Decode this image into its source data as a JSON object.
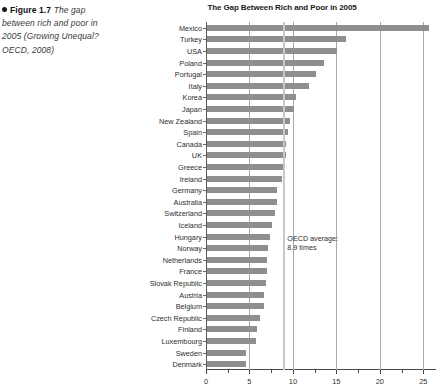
{
  "caption": {
    "figure_label": "Figure 1.7",
    "text": "The gap between rich and poor in 2005 (Growing Unequal? OECD, 2008)",
    "line1": "The gap",
    "line2": "between rich and poor in",
    "line3": "2005 (Growing Unequal?",
    "line4": "OECD, 2008)"
  },
  "chart_data": {
    "type": "bar",
    "orientation": "horizontal",
    "title": "The Gap Between Rich and Poor in 2005",
    "xlabel": "",
    "ylabel": "",
    "xlim": [
      0,
      26
    ],
    "xticks": [
      0,
      5,
      10,
      15,
      20,
      25
    ],
    "xticklabels": [
      "0",
      "5",
      "10",
      "15",
      "20",
      "25"
    ],
    "grid": true,
    "grid_axis": "x",
    "legend": false,
    "bar_color": "#8e8e8e",
    "categories": [
      "Mexico",
      "Turkey",
      "USA",
      "Poland",
      "Portugal",
      "Italy",
      "Korea",
      "Japan",
      "New Zealand",
      "Spain",
      "Canada",
      "UK",
      "Greece",
      "Ireland",
      "Germany",
      "Australia",
      "Switzerland",
      "Iceland",
      "Hungary",
      "Norway",
      "Netherlands",
      "France",
      "Slovak Republic",
      "Austria",
      "Belgium",
      "Czech Republic",
      "Finland",
      "Luxembourg",
      "Sweden",
      "Denmark"
    ],
    "values": [
      25.5,
      16.0,
      14.9,
      13.5,
      12.5,
      11.7,
      10.2,
      10.0,
      9.6,
      9.3,
      9.1,
      9.1,
      8.9,
      8.6,
      8.1,
      8.0,
      7.8,
      7.5,
      7.2,
      7.0,
      6.9,
      6.9,
      6.8,
      6.6,
      6.5,
      6.1,
      5.7,
      5.6,
      4.5,
      4.5
    ],
    "annotations": [
      {
        "name": "oecd-average",
        "value": 8.9,
        "label_line1": "OECD average:",
        "label_line2": "8.9 times",
        "color": "#c9c9c9"
      }
    ]
  }
}
